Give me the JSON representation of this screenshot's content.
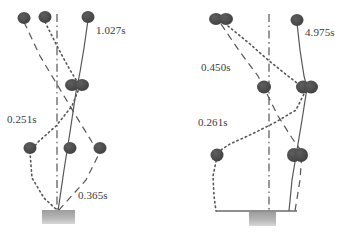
{
  "figure": {
    "type": "pendulum-motion-trace-diagram",
    "background_color": "#ffffff",
    "marker_color": "#4a4a4a",
    "line_color": "#555555",
    "base_color": "#b0b0b0",
    "panels": [
      {
        "id": "left-panel",
        "name": "left-pendulum-diagram",
        "labels": [
          {
            "id": "left-label-top",
            "text": "1.027s",
            "x": 96,
            "y": 25
          },
          {
            "id": "left-label-mid",
            "text": "0.251s",
            "x": 7,
            "y": 114
          },
          {
            "id": "left-label-bottom",
            "text": "0.365s",
            "x": 78,
            "y": 190
          }
        ],
        "markers": [
          {
            "id": "L-top-1",
            "cx": 24,
            "cy": 18,
            "rx": 6.5,
            "ry": 6
          },
          {
            "id": "L-top-2",
            "cx": 45,
            "cy": 17,
            "rx": 6.5,
            "ry": 6
          },
          {
            "id": "L-top-3",
            "cx": 88,
            "cy": 17,
            "rx": 6.5,
            "ry": 6
          },
          {
            "id": "L-mid-1",
            "cx": 72,
            "cy": 85,
            "rx": 7,
            "ry": 6
          },
          {
            "id": "L-mid-2",
            "cx": 82,
            "cy": 85,
            "rx": 7,
            "ry": 6
          },
          {
            "id": "L-low-1",
            "cx": 30,
            "cy": 148,
            "rx": 6.5,
            "ry": 6
          },
          {
            "id": "L-low-2",
            "cx": 70,
            "cy": 148,
            "rx": 6.5,
            "ry": 6
          },
          {
            "id": "L-low-3",
            "cx": 100,
            "cy": 148,
            "rx": 6.5,
            "ry": 6
          }
        ],
        "pivot": {
          "x": 58,
          "y": 211
        },
        "base": {
          "x": 42,
          "y": 210,
          "w": 33,
          "h": 14
        },
        "paths": [
          {
            "id": "L-solid-path",
            "style": "solid",
            "points": "88,20 84,48 80,72 76,92 70,132 64,170 58,211"
          },
          {
            "id": "L-dashed-path",
            "style": "dashed",
            "points": "24,22 40,56 58,86 76,116 92,142 100,152 86,180 58,211"
          },
          {
            "id": "L-dotted-path",
            "style": "dotted",
            "points": "45,22 58,48 70,70 80,86 72,106 56,126 38,142 30,152 32,178 44,198 58,211"
          }
        ],
        "axis": {
          "id": "L-axis",
          "style": "dashdot",
          "x": 57,
          "y1": 14,
          "y2": 212
        }
      },
      {
        "id": "right-panel",
        "name": "right-pendulum-diagram",
        "labels": [
          {
            "id": "right-label-top",
            "text": "4.975s",
            "x": 305,
            "y": 27
          },
          {
            "id": "right-label-mid",
            "text": "0.450s",
            "x": 201,
            "y": 62
          },
          {
            "id": "right-label-bottom",
            "text": "0.261s",
            "x": 198,
            "y": 117
          }
        ],
        "markers": [
          {
            "id": "R-top-1",
            "cx": 216,
            "cy": 19,
            "rx": 7,
            "ry": 6
          },
          {
            "id": "R-top-2",
            "cx": 226,
            "cy": 19,
            "rx": 7,
            "ry": 6
          },
          {
            "id": "R-top-3",
            "cx": 297,
            "cy": 20,
            "rx": 6.5,
            "ry": 6
          },
          {
            "id": "R-mid-1",
            "cx": 264,
            "cy": 87,
            "rx": 7,
            "ry": 6.5
          },
          {
            "id": "R-mid-2",
            "cx": 303,
            "cy": 87,
            "rx": 7,
            "ry": 6.5
          },
          {
            "id": "R-mid-3",
            "cx": 311,
            "cy": 87,
            "rx": 7,
            "ry": 6.5
          },
          {
            "id": "R-low-1",
            "cx": 217,
            "cy": 155,
            "rx": 6.5,
            "ry": 6.5
          },
          {
            "id": "R-low-2",
            "cx": 294,
            "cy": 155,
            "rx": 7,
            "ry": 7
          },
          {
            "id": "R-low-3",
            "cx": 301,
            "cy": 155,
            "rx": 7,
            "ry": 7
          }
        ],
        "ground": {
          "x1": 216,
          "x2": 297,
          "y": 211
        },
        "base": {
          "x": 249,
          "y": 212,
          "w": 27,
          "h": 14
        },
        "paths": [
          {
            "id": "R-solid-path",
            "style": "solid",
            "points": "297,23 300,50 304,76 307,88 302,120 297,150 292,180 289,211"
          },
          {
            "id": "R-dashed-path",
            "style": "dashed",
            "points": "221,24 240,52 258,76 266,92 278,116 292,138 302,152 300,180 295,211"
          },
          {
            "id": "R-dotted-path",
            "style": "dotted",
            "points": "228,26 250,44 268,60 288,76 306,90 296,110 276,122 252,134 230,144 218,152 213,176 214,196 216,211"
          }
        ],
        "axis": {
          "id": "R-axis",
          "style": "dashdot",
          "x": 269,
          "y1": 14,
          "y2": 212
        }
      }
    ]
  }
}
